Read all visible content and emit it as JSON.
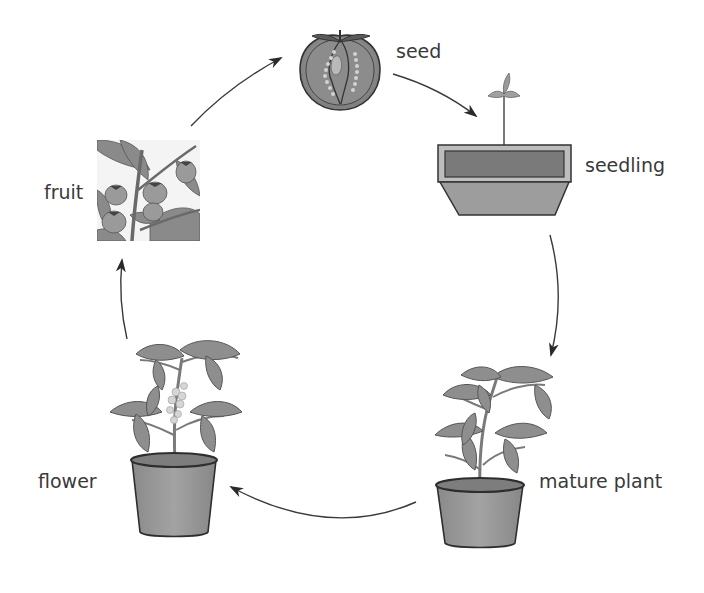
{
  "diagram": {
    "type": "cycle",
    "direction": "clockwise",
    "stages": [
      {
        "id": "seed",
        "label": "seed",
        "icon": "tomato-cross-section-icon"
      },
      {
        "id": "seedling",
        "label": "seedling",
        "icon": "seedling-tray-icon"
      },
      {
        "id": "mature",
        "label": "mature plant",
        "icon": "potted-plant-icon"
      },
      {
        "id": "flower",
        "label": "flower",
        "icon": "flowering-plant-icon"
      },
      {
        "id": "fruit",
        "label": "fruit",
        "icon": "fruiting-branch-icon"
      }
    ],
    "edges": [
      {
        "from": "seed",
        "to": "seedling"
      },
      {
        "from": "seedling",
        "to": "mature"
      },
      {
        "from": "mature",
        "to": "flower"
      },
      {
        "from": "flower",
        "to": "fruit"
      },
      {
        "from": "fruit",
        "to": "seed"
      }
    ],
    "colors": {
      "arrow": "#333333",
      "label": "#3a3a3a",
      "fill_mid": "#8f8f8f",
      "fill_light": "#b8b8b8",
      "fill_dark": "#6a6a6a",
      "outline": "#333333"
    }
  }
}
